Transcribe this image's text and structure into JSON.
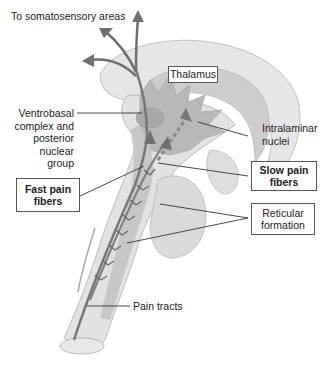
{
  "labels": {
    "somatosensory": "To somatosensory areas",
    "thalamus": "Thalamus",
    "ventrobasal_lines": [
      "Ventrobasal",
      "complex and",
      "posterior",
      "nuclear",
      "group"
    ],
    "intralaminar_lines": [
      "Intralaminar",
      "nuclei"
    ],
    "fast_pain_lines": [
      "Fast pain",
      "fibers"
    ],
    "slow_pain_lines": [
      "Slow pain",
      "fibers"
    ],
    "reticular_lines": [
      "Reticular",
      "formation"
    ],
    "pain_tracts": "Pain tracts"
  },
  "colors": {
    "brain_light": "#e4e4e4",
    "brain_mid": "#cfcfcf",
    "brain_dark": "#b5b5b5",
    "tract": "#7d7d7d",
    "arrow": "#6f6f6f",
    "outline": "#b0b0b0",
    "leader": "#333333"
  }
}
